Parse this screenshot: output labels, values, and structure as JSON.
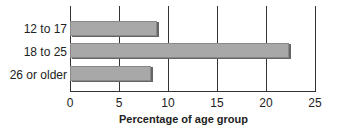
{
  "chart_data": {
    "type": "bar",
    "orientation": "horizontal",
    "categories": [
      "12 to 17",
      "18 to 25",
      "26 or older"
    ],
    "values": [
      8.9,
      22.3,
      8.3
    ],
    "title": "",
    "xlabel": "Percentage of age group",
    "ylabel": "",
    "xlim": [
      0,
      25
    ],
    "xticks": [
      "0",
      "5",
      "10",
      "15",
      "20",
      "25"
    ],
    "grid": "vertical",
    "legend": null,
    "colors": {
      "bar": "#a8a8a8",
      "bar_shadow": "#666666"
    }
  }
}
